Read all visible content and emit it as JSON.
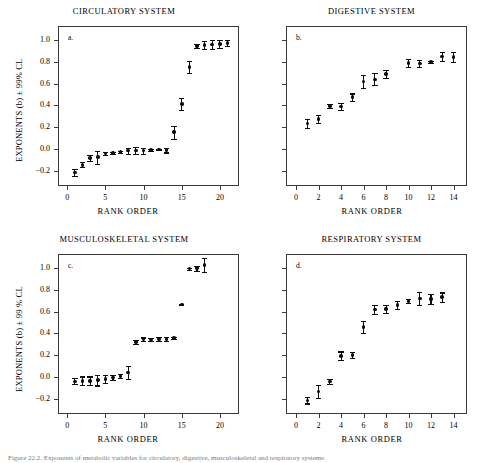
{
  "figure": {
    "caption": "Figure 22.2. Exponents of metabolic variables for circulatory, digestive, musculoskeletal and respiratory systems"
  },
  "chart_data": [
    {
      "id": "a",
      "type": "scatter",
      "title": "CIRCULATORY SYSTEM",
      "panel_letter": "a.",
      "xlabel": "RANK ORDER",
      "ylabel": "EXPONENTS (b) ± 99% CL",
      "xlim": [
        -1.2,
        22.5
      ],
      "ylim": [
        -0.34,
        1.13
      ],
      "xticks": [
        0,
        5,
        10,
        15,
        20
      ],
      "xtick_labels": [
        "0",
        "5",
        "10",
        "15",
        "20"
      ],
      "yticks": [
        -0.2,
        0.0,
        0.2,
        0.4,
        0.6,
        0.8,
        1.0
      ],
      "ytick_labels": [
        "−0.2",
        "0.0",
        "0.2",
        "0.4",
        "0.6",
        "0.8",
        "1.0"
      ],
      "show_ytick_labels": true,
      "grid": false,
      "x": [
        1,
        2,
        3,
        4,
        5,
        6,
        7,
        8,
        9,
        10,
        11,
        12,
        13,
        14,
        15,
        16,
        17,
        18,
        19,
        20,
        21
      ],
      "values": [
        -0.215,
        -0.145,
        -0.085,
        -0.075,
        -0.04,
        -0.035,
        -0.03,
        -0.015,
        -0.015,
        -0.015,
        -0.01,
        -0.005,
        -0.01,
        0.155,
        0.415,
        0.755,
        0.945,
        0.955,
        0.96,
        0.965,
        0.975
      ],
      "err": [
        0.03,
        0.022,
        0.028,
        0.06,
        0.012,
        0.01,
        0.01,
        0.028,
        0.03,
        0.028,
        0.01,
        0.006,
        0.022,
        0.06,
        0.055,
        0.055,
        0.018,
        0.038,
        0.038,
        0.038,
        0.03
      ]
    },
    {
      "id": "b",
      "type": "scatter",
      "title": "DIGESTIVE SYSTEM",
      "panel_letter": "b.",
      "xlabel": "RANK ORDER",
      "ylabel": "",
      "xlim": [
        -0.9,
        15.2
      ],
      "ylim": [
        -0.34,
        1.13
      ],
      "xticks": [
        0,
        2,
        4,
        6,
        8,
        10,
        12,
        14
      ],
      "xtick_labels": [
        "0",
        "2",
        "4",
        "6",
        "8",
        "10",
        "12",
        "14"
      ],
      "yticks": [
        -0.2,
        0.0,
        0.2,
        0.4,
        0.6,
        0.8,
        1.0
      ],
      "ytick_labels": [
        "",
        "",
        "",
        "",
        "",
        "",
        ""
      ],
      "show_ytick_labels": false,
      "grid": false,
      "x": [
        1,
        2,
        3,
        4,
        5,
        6,
        7,
        8,
        10,
        11,
        12,
        13,
        14
      ],
      "values": [
        0.235,
        0.275,
        0.395,
        0.39,
        0.475,
        0.62,
        0.64,
        0.69,
        0.79,
        0.785,
        0.8,
        0.85,
        0.845
      ],
      "err": [
        0.04,
        0.035,
        0.018,
        0.03,
        0.035,
        0.06,
        0.055,
        0.038,
        0.038,
        0.03,
        0.012,
        0.04,
        0.045
      ]
    },
    {
      "id": "c",
      "type": "scatter",
      "title": "MUSCULOSKELETAL SYSTEM",
      "panel_letter": "c.",
      "xlabel": "RANK ORDER",
      "ylabel": "EXPONENTS (b) ± 99 % CL",
      "xlim": [
        -1.2,
        22.5
      ],
      "ylim": [
        -0.34,
        1.13
      ],
      "xticks": [
        0,
        5,
        10,
        15,
        20
      ],
      "xtick_labels": [
        "0",
        "5",
        "10",
        "15",
        "20"
      ],
      "yticks": [
        -0.2,
        0.0,
        0.2,
        0.4,
        0.6,
        0.8,
        1.0
      ],
      "ytick_labels": [
        "−0.2",
        "0.0",
        "0.2",
        "0.4",
        "0.6",
        "0.8",
        "1.0"
      ],
      "show_ytick_labels": true,
      "grid": false,
      "x": [
        1,
        2,
        3,
        4,
        5,
        6,
        7,
        8,
        9,
        10,
        11,
        12,
        13,
        14,
        15,
        16,
        17,
        18
      ],
      "values": [
        -0.04,
        -0.035,
        -0.035,
        -0.03,
        -0.02,
        -0.005,
        0.01,
        0.04,
        0.32,
        0.345,
        0.345,
        0.35,
        0.35,
        0.36,
        0.665,
        0.995,
        1.0,
        1.03
      ],
      "err": [
        0.028,
        0.04,
        0.04,
        0.048,
        0.035,
        0.022,
        0.022,
        0.06,
        0.02,
        0.018,
        0.012,
        0.018,
        0.018,
        0.012,
        0.004,
        0.01,
        0.022,
        0.062
      ]
    },
    {
      "id": "d",
      "type": "scatter",
      "title": "RESPIRATORY SYSTEM",
      "panel_letter": "d.",
      "xlabel": "RANK ORDER",
      "ylabel": "",
      "xlim": [
        -0.9,
        15.2
      ],
      "ylim": [
        -0.34,
        1.13
      ],
      "xticks": [
        0,
        2,
        4,
        6,
        8,
        10,
        12,
        14
      ],
      "xtick_labels": [
        "0",
        "2",
        "4",
        "6",
        "8",
        "10",
        "12",
        "14"
      ],
      "yticks": [
        -0.2,
        0.0,
        0.2,
        0.4,
        0.6,
        0.8,
        1.0
      ],
      "ytick_labels": [
        "",
        "",
        "",
        "",
        "",
        "",
        ""
      ],
      "show_ytick_labels": false,
      "grid": false,
      "x": [
        1,
        2,
        3,
        4,
        5,
        6,
        7,
        8,
        9,
        10,
        11,
        12,
        13
      ],
      "values": [
        -0.215,
        -0.135,
        -0.04,
        0.195,
        0.2,
        0.46,
        0.62,
        0.625,
        0.66,
        0.7,
        0.72,
        0.715,
        0.735
      ],
      "err": [
        0.028,
        0.06,
        0.022,
        0.04,
        0.028,
        0.058,
        0.04,
        0.038,
        0.038,
        0.016,
        0.062,
        0.048,
        0.042
      ]
    }
  ]
}
